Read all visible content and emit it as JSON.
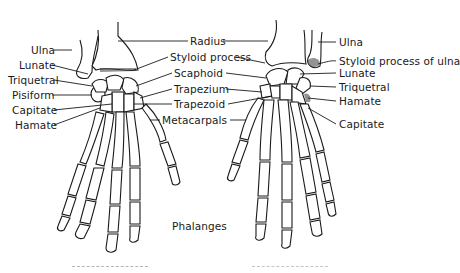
{
  "figure": {
    "type": "anatomical line drawing",
    "views": [
      {
        "id": "left-hand",
        "labels_left": [
          "Ulna",
          "Lunate",
          "Triquetral",
          "Pisiform",
          "Capitate",
          "Hamate"
        ]
      },
      {
        "id": "right-hand",
        "labels_right": [
          "Ulna",
          "Styloid process of ulna",
          "Lunate",
          "Triquetral",
          "Hamate",
          "Capitate"
        ]
      }
    ],
    "center_labels": [
      "Radius",
      "Styloid process",
      "Scaphoid",
      "Trapezium",
      "Trapezoid",
      "Metacarpals",
      "Phalanges"
    ],
    "captions_truncated": true
  },
  "labels": {
    "left": {
      "ulna": "Ulna",
      "lunate": "Lunate",
      "triquetral": "Triquetral",
      "pisiform": "Pisiform",
      "capitate": "Capitate",
      "hamate": "Hamate"
    },
    "center": {
      "radius": "Radius",
      "styloid_process": "Styloid process",
      "scaphoid": "Scaphoid",
      "trapezium": "Trapezium",
      "trapezoid": "Trapezoid",
      "metacarpals": "Metacarpals",
      "phalanges": "Phalanges"
    },
    "right": {
      "ulna": "Ulna",
      "styloid_process_of_ulna": "Styloid process of ulna",
      "lunate": "Lunate",
      "triquetral": "Triquetral",
      "hamate": "Hamate",
      "capitate": "Capitate"
    }
  },
  "colors": {
    "ink": "#1a1a1a",
    "background": "#ffffff"
  }
}
